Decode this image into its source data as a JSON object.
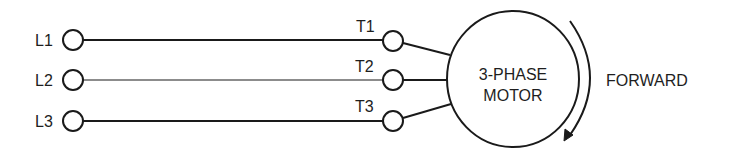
{
  "diagram": {
    "colors": {
      "stroke": "#1a1a1a",
      "text": "#1e1e1e",
      "background": "#ffffff"
    },
    "lines": [
      {
        "source": "L1",
        "terminal": "T1",
        "y": 40
      },
      {
        "source": "L2",
        "terminal": "T2",
        "y": 80
      },
      {
        "source": "L3",
        "terminal": "T3",
        "y": 121
      }
    ],
    "labels": {
      "l1": "L1",
      "l2": "L2",
      "l3": "L3",
      "t1": "T1",
      "t2": "T2",
      "t3": "T3"
    },
    "motor": {
      "line1": "3-PHASE",
      "line2": "MOTOR"
    },
    "rotation": {
      "direction": "clockwise",
      "label": "FORWARD"
    }
  }
}
